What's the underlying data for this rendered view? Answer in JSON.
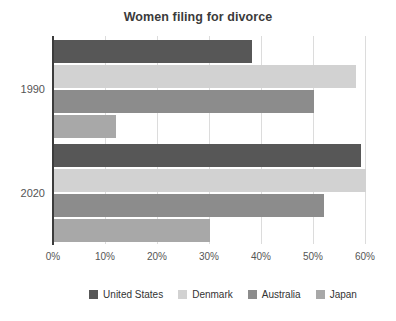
{
  "chart_data": {
    "type": "bar",
    "orientation": "horizontal",
    "title": "Women filing for divorce",
    "xlabel": "",
    "ylabel": "",
    "categories": [
      "1990",
      "2020"
    ],
    "series": [
      {
        "name": "United States",
        "color": "#575757",
        "values": [
          38,
          59
        ]
      },
      {
        "name": "Denmark",
        "color": "#d2d2d2",
        "values": [
          58,
          60
        ]
      },
      {
        "name": "Australia",
        "color": "#8c8c8c",
        "values": [
          50,
          52
        ]
      },
      {
        "name": "Japan",
        "color": "#a8a8a8",
        "values": [
          12,
          30
        ]
      }
    ],
    "x_ticks": [
      "0%",
      "10%",
      "20%",
      "30%",
      "40%",
      "50%",
      "60%"
    ],
    "x_tick_values": [
      0,
      10,
      20,
      30,
      40,
      50,
      60
    ],
    "xlim": [
      0,
      62
    ],
    "grid": "vertical",
    "legend_position": "bottom",
    "axis_color": "#3c3c3c",
    "gridline_color": "#dcdcdc",
    "text_color": "#555555"
  }
}
